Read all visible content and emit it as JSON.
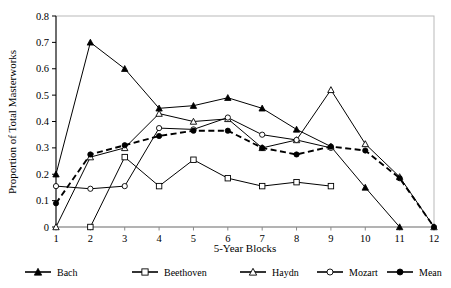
{
  "chart_data": {
    "type": "line",
    "title": "",
    "xlabel": "5-Year Blocks",
    "ylabel": "Proportion of Total Masterworks",
    "categories": [
      1,
      2,
      3,
      4,
      5,
      6,
      7,
      8,
      9,
      10,
      11,
      12
    ],
    "x": [
      1,
      2,
      3,
      4,
      5,
      6,
      7,
      8,
      9,
      10,
      11,
      12
    ],
    "xlim": [
      1,
      12
    ],
    "ylim": [
      0,
      0.8
    ],
    "ytick_labels": [
      "0",
      "0.1",
      "0.2",
      "0.3",
      "0.4",
      "0.5",
      "0.6",
      "0.7",
      "0.8"
    ],
    "yticks": [
      0,
      0.1,
      0.2,
      0.3,
      0.4,
      0.5,
      0.6,
      0.7,
      0.8
    ],
    "xtick_labels": [
      "1",
      "2",
      "3",
      "4",
      "5",
      "6",
      "7",
      "8",
      "9",
      "10",
      "11",
      "12"
    ],
    "grid": false,
    "legend_position": "bottom",
    "series": [
      {
        "name": "Bach",
        "marker": "filled-triangle",
        "dash": false,
        "color": "#000000",
        "x": [
          1,
          2,
          3,
          4,
          5,
          6,
          7,
          8,
          9,
          10,
          11
        ],
        "values": [
          0.2,
          0.7,
          0.6,
          0.45,
          0.46,
          0.49,
          0.45,
          0.37,
          0.305,
          0.15,
          0.0
        ]
      },
      {
        "name": "Beethoven",
        "marker": "open-square",
        "dash": false,
        "color": "#000000",
        "x": [
          2,
          3,
          4,
          5,
          6,
          7,
          8,
          9
        ],
        "values": [
          0.0,
          0.265,
          0.155,
          0.255,
          0.185,
          0.155,
          0.17,
          0.155
        ]
      },
      {
        "name": "Haydn",
        "marker": "open-triangle",
        "dash": false,
        "color": "#000000",
        "x": [
          1,
          2,
          3,
          4,
          5,
          6,
          7,
          8,
          9,
          10,
          11,
          12
        ],
        "values": [
          0.0,
          0.265,
          0.3,
          0.43,
          0.4,
          0.41,
          0.3,
          0.33,
          0.52,
          0.315,
          0.19,
          0.0
        ]
      },
      {
        "name": "Mozart",
        "marker": "open-circle",
        "dash": false,
        "color": "#000000",
        "x": [
          1,
          2,
          3,
          4,
          5,
          6,
          7,
          8,
          9
        ],
        "values": [
          0.155,
          0.145,
          0.155,
          0.375,
          0.37,
          0.415,
          0.35,
          0.33,
          0.3
        ]
      },
      {
        "name": "Mean",
        "marker": "filled-circle",
        "dash": true,
        "color": "#000000",
        "x": [
          1,
          2,
          3,
          4,
          5,
          6,
          7,
          8,
          9,
          10,
          11,
          12
        ],
        "values": [
          0.09,
          0.275,
          0.31,
          0.345,
          0.365,
          0.365,
          0.3,
          0.275,
          0.305,
          0.29,
          0.185,
          0.0
        ]
      }
    ],
    "legend": [
      {
        "label": "Bach",
        "marker": "filled-triangle",
        "dash": false
      },
      {
        "label": "Beethoven",
        "marker": "open-square",
        "dash": false
      },
      {
        "label": "Haydn",
        "marker": "open-triangle",
        "dash": false
      },
      {
        "label": "Mozart",
        "marker": "open-circle",
        "dash": false
      },
      {
        "label": "Mean",
        "marker": "filled-circle",
        "dash": false
      }
    ]
  }
}
